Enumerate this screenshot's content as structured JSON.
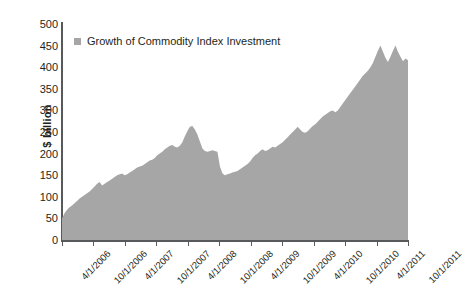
{
  "chart_data": {
    "type": "area",
    "title": "",
    "xlabel": "",
    "ylabel": "$ billion",
    "ylim": [
      0,
      500
    ],
    "ytick_values": [
      0,
      50,
      100,
      150,
      200,
      250,
      300,
      350,
      400,
      450,
      500
    ],
    "grid": false,
    "legend_position": "top-left",
    "series_name": "Growth of Commodity Index Investment",
    "series_color": "#a6a6a6",
    "x_tick_labels": [
      "4/1/2006",
      "10/1/2006",
      "4/1/2007",
      "10/1/2007",
      "4/1/2008",
      "10/1/2008",
      "4/1/2009",
      "10/1/2009",
      "4/1/2010",
      "10/1/2010",
      "4/1/2011",
      "10/1/2011"
    ],
    "x_tick_positions": [
      0,
      1,
      2,
      3,
      4,
      5,
      6,
      7,
      8,
      9,
      10,
      11
    ],
    "x_unit": "half-year periods from 4/1/2006 to 10/1/2011",
    "values": [
      50,
      62,
      70,
      76,
      80,
      85,
      90,
      96,
      100,
      104,
      108,
      112,
      118,
      124,
      130,
      134,
      126,
      130,
      134,
      138,
      142,
      146,
      150,
      152,
      154,
      150,
      152,
      156,
      160,
      164,
      168,
      170,
      172,
      176,
      180,
      184,
      186,
      190,
      196,
      200,
      204,
      210,
      214,
      218,
      220,
      216,
      214,
      218,
      226,
      240,
      252,
      262,
      264,
      256,
      244,
      228,
      212,
      206,
      204,
      206,
      208,
      206,
      204,
      170,
      154,
      150,
      152,
      154,
      156,
      158,
      160,
      164,
      168,
      172,
      176,
      182,
      190,
      196,
      200,
      206,
      210,
      206,
      208,
      212,
      216,
      214,
      218,
      222,
      226,
      232,
      238,
      244,
      250,
      256,
      262,
      256,
      250,
      248,
      252,
      258,
      264,
      268,
      274,
      280,
      286,
      290,
      294,
      298,
      300,
      296,
      300,
      308,
      316,
      324,
      332,
      340,
      348,
      356,
      364,
      372,
      380,
      386,
      392,
      400,
      410,
      424,
      438,
      450,
      436,
      422,
      412,
      424,
      438,
      450,
      436,
      424,
      414,
      420,
      416
    ],
    "series_start_value": 50,
    "series_end_value": 416,
    "series_max_value": 450,
    "series_min_value": 50,
    "peak_2008_value": 264,
    "trough_2008_value": 150
  }
}
